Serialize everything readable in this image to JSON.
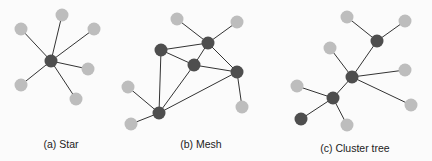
{
  "colors": {
    "coordinator": "#4e4e4e",
    "end_device": "#bdbdbd",
    "edge": "#333333",
    "background": "#fbfbfb"
  },
  "diagrams": [
    {
      "id": "star",
      "caption": "(a) Star",
      "caption_pos": [
        61,
        138
      ],
      "nodes": [
        {
          "x": 51,
          "y": 61,
          "type": "dark"
        },
        {
          "x": 21,
          "y": 29,
          "type": "light"
        },
        {
          "x": 62,
          "y": 15,
          "type": "light"
        },
        {
          "x": 94,
          "y": 29,
          "type": "light"
        },
        {
          "x": 88,
          "y": 69,
          "type": "light"
        },
        {
          "x": 21,
          "y": 85,
          "type": "light"
        },
        {
          "x": 76,
          "y": 99,
          "type": "light"
        }
      ],
      "edges": [
        [
          0,
          1
        ],
        [
          0,
          2
        ],
        [
          0,
          3
        ],
        [
          0,
          4
        ],
        [
          0,
          5
        ],
        [
          0,
          6
        ]
      ]
    },
    {
      "id": "mesh",
      "caption": "(b) Mesh",
      "caption_pos": [
        201,
        138
      ],
      "nodes": [
        {
          "x": 177,
          "y": 19,
          "type": "light"
        },
        {
          "x": 237,
          "y": 22,
          "type": "light"
        },
        {
          "x": 208,
          "y": 43,
          "type": "dark"
        },
        {
          "x": 161,
          "y": 50,
          "type": "dark"
        },
        {
          "x": 194,
          "y": 65,
          "type": "dark"
        },
        {
          "x": 237,
          "y": 72,
          "type": "dark"
        },
        {
          "x": 128,
          "y": 87,
          "type": "light"
        },
        {
          "x": 242,
          "y": 107,
          "type": "light"
        },
        {
          "x": 159,
          "y": 113,
          "type": "dark"
        },
        {
          "x": 131,
          "y": 124,
          "type": "light"
        }
      ],
      "edges": [
        [
          0,
          2
        ],
        [
          1,
          2
        ],
        [
          2,
          3
        ],
        [
          2,
          4
        ],
        [
          2,
          5
        ],
        [
          3,
          4
        ],
        [
          4,
          5
        ],
        [
          3,
          8
        ],
        [
          4,
          8
        ],
        [
          5,
          8
        ],
        [
          5,
          7
        ],
        [
          6,
          8
        ],
        [
          9,
          8
        ]
      ]
    },
    {
      "id": "cluster-tree",
      "caption": "(c) Cluster tree",
      "caption_pos": [
        355,
        142
      ],
      "nodes": [
        {
          "x": 347,
          "y": 17,
          "type": "light"
        },
        {
          "x": 405,
          "y": 21,
          "type": "light"
        },
        {
          "x": 377,
          "y": 41,
          "type": "dark"
        },
        {
          "x": 330,
          "y": 48,
          "type": "light"
        },
        {
          "x": 352,
          "y": 77,
          "type": "dark"
        },
        {
          "x": 405,
          "y": 70,
          "type": "light"
        },
        {
          "x": 297,
          "y": 86,
          "type": "light"
        },
        {
          "x": 411,
          "y": 105,
          "type": "light"
        },
        {
          "x": 333,
          "y": 98,
          "type": "dark"
        },
        {
          "x": 301,
          "y": 119,
          "type": "dark"
        },
        {
          "x": 347,
          "y": 125,
          "type": "light"
        }
      ],
      "edges": [
        [
          0,
          2
        ],
        [
          1,
          2
        ],
        [
          2,
          4
        ],
        [
          3,
          4
        ],
        [
          4,
          5
        ],
        [
          4,
          7
        ],
        [
          4,
          8
        ],
        [
          6,
          8
        ],
        [
          8,
          9
        ],
        [
          8,
          10
        ]
      ]
    }
  ]
}
